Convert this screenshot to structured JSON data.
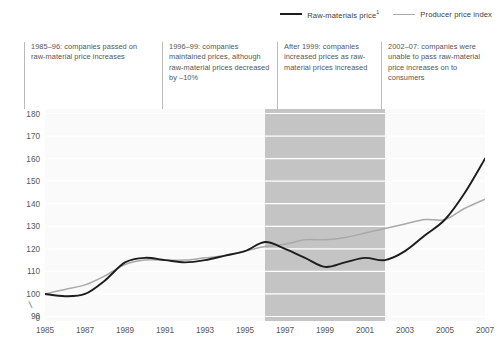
{
  "legend": {
    "items": [
      {
        "label": "Raw-materials price",
        "footnote": "1",
        "color": "#1d1d1d",
        "style": "dark"
      },
      {
        "label": "Producer price index",
        "footnote": "",
        "color": "#a9a9a9",
        "style": "grey"
      }
    ]
  },
  "annotations": [
    {
      "text": "1985–96: companies passed on raw-material price increases",
      "x_year": 1987
    },
    {
      "text": "1996–99: companies maintained prices, although raw-material prices decreased by –10%",
      "x_year": 1994
    },
    {
      "text": "After 1999: companies increased prices as raw-material prices increased",
      "x_year": 1999
    },
    {
      "text": "2002–07: companies were unable to pass raw-material price increases on to consumers",
      "x_year": 2004
    }
  ],
  "axis": {
    "y_ticks": [
      "180",
      "170",
      "160",
      "150",
      "140",
      "130",
      "120",
      "110",
      "100",
      "90",
      "0"
    ],
    "y_break_symbol": "∕∕",
    "x_ticks": [
      "1985",
      "1987",
      "1989",
      "1991",
      "1993",
      "1995",
      "1997",
      "1999",
      "2001",
      "2003",
      "2005",
      "2007"
    ]
  },
  "colors": {
    "raw_materials": "#1d1d1d",
    "producer_index": "#a9a9a9",
    "band": "#c4c4c4",
    "plot_background": "#fafafa",
    "gridline": "#ffffff",
    "axis_text": "#55595c"
  },
  "chart_data": {
    "type": "line",
    "title": "",
    "subtitle": "",
    "xlabel": "",
    "ylabel": "",
    "xlim": [
      1985,
      2007
    ],
    "ylim": [
      88,
      182
    ],
    "grid": true,
    "legend_position": "top-right",
    "highlight_band": {
      "from": 1996,
      "to": 2002,
      "color": "#c4c4c4",
      "label": ""
    },
    "x": [
      1985,
      1986,
      1987,
      1988,
      1989,
      1990,
      1991,
      1992,
      1993,
      1994,
      1995,
      1996,
      1997,
      1998,
      1999,
      2000,
      2001,
      2002,
      2003,
      2004,
      2005,
      2006,
      2007
    ],
    "series": [
      {
        "name": "Raw-materials price",
        "color": "#1d1d1d",
        "values": [
          100,
          99,
          100,
          106,
          114,
          116,
          115,
          114,
          115,
          117,
          119,
          123,
          120,
          116,
          112,
          114,
          116,
          115,
          119,
          126,
          133,
          145,
          160
        ]
      },
      {
        "name": "Producer price index",
        "color": "#a9a9a9",
        "values": [
          100,
          102,
          104,
          108,
          113,
          115,
          115,
          115,
          116,
          117,
          119,
          121,
          122,
          124,
          124,
          125,
          127,
          129,
          131,
          133,
          133,
          138,
          142
        ]
      }
    ]
  }
}
